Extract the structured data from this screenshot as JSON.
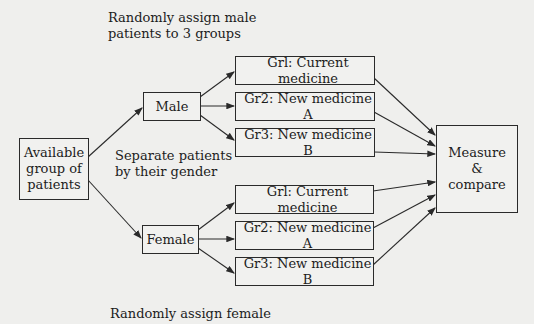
{
  "annotations": {
    "male_assign": [
      "Randomly assign male",
      "patients to 3 groups"
    ],
    "separate": [
      "Separate patients",
      "by their gender"
    ],
    "female_assign": "Randomly assign female"
  },
  "nodes": {
    "available": [
      "Available",
      "group of",
      "patients"
    ],
    "male": "Male",
    "female": "Female",
    "male_groups": [
      "Grl: Current medicine",
      "Gr2: New medicine A",
      "Gr3: New medicine B"
    ],
    "female_groups": [
      "Grl: Current medicine",
      "Gr2: New medicine A",
      "Gr3: New medicine B"
    ],
    "measure": [
      "Measure",
      "&",
      "compare"
    ]
  },
  "colors": {
    "background": "#efefed",
    "stroke": "#2a2a2a",
    "text": "#1c1c1c"
  }
}
